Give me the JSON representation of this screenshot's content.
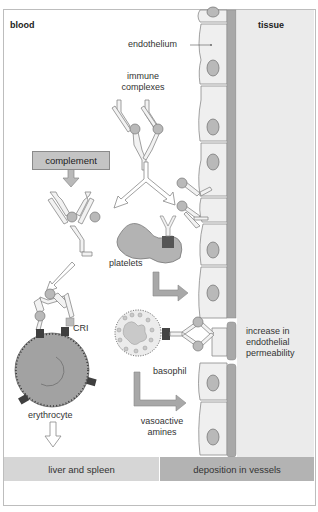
{
  "regions": {
    "blood": "blood",
    "tissue": "tissue"
  },
  "labels": {
    "endothelium": "endothelium",
    "immune_complexes_line1": "immune",
    "immune_complexes_line2": "complexes",
    "complement": "complement",
    "platelets": "platelets",
    "cr1": "CRI",
    "erythrocyte": "erythrocyte",
    "basophil": "basophil",
    "permeability_line1": "increase in",
    "permeability_line2": "endothelial",
    "permeability_line3": "permeability",
    "vasoactive_line1": "vasoactive",
    "vasoactive_line2": "amines"
  },
  "footer": {
    "left": "liver and spleen",
    "right": "deposition in vessels"
  },
  "colors": {
    "tissue": "#ebebeb",
    "basement_membrane": "#a8a8a8",
    "cell_fill": "#efefef",
    "nucleus": "#b9b9b9",
    "complement_box": "#c4c4c4",
    "receptor": "#4a4a4a",
    "footer_left": "#d6d6d6",
    "footer_right": "#b3b3b3"
  }
}
